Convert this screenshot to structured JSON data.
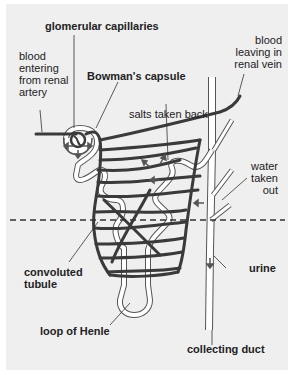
{
  "diagram": {
    "labels": {
      "glomerular_capillaries": "glomerular capillaries",
      "blood_entering": "blood\nentering\nfrom renal\nartery",
      "bowmans_capsule": "Bowman's capsule",
      "blood_leaving": "blood\nleaving in\nrenal vein",
      "salts_taken_back": "salts taken back",
      "water_taken_out": "water\ntaken\nout",
      "convoluted_tubule": "convoluted\ntubule",
      "urine": "urine",
      "loop_of_henle": "loop of Henle",
      "collecting_duct": "collecting duct"
    },
    "colors": {
      "background": "#efefef",
      "vessel": "#3a3a3a",
      "tubule_outline": "#555555",
      "tubule_fill": "#ffffff",
      "text": "#222222"
    }
  }
}
